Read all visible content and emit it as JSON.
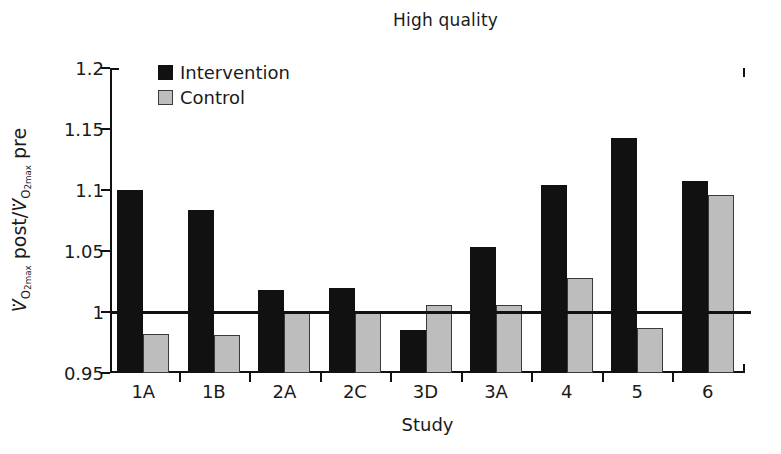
{
  "chart_data": {
    "type": "bar",
    "title": "High quality",
    "xlabel": "Study",
    "ylabel": "VO2max post/VO2max pre",
    "categories": [
      "1A",
      "1B",
      "2A",
      "2C",
      "3D",
      "3A",
      "4",
      "5",
      "6"
    ],
    "series": [
      {
        "name": "Intervention",
        "color": "#111111",
        "values": [
          1.1,
          1.084,
          1.018,
          1.02,
          0.985,
          1.053,
          1.104,
          1.143,
          1.107
        ]
      },
      {
        "name": "Control",
        "color": "#bdbdbd",
        "values": [
          0.982,
          0.981,
          1.001,
          1.001,
          1.006,
          1.006,
          1.028,
          0.987,
          1.096
        ]
      }
    ],
    "ylim": [
      0.95,
      1.2
    ],
    "yticks": [
      0.95,
      1.0,
      1.05,
      1.1,
      1.15,
      1.2
    ],
    "ytick_labels": [
      "0.95",
      "1",
      "1.05",
      "1.1",
      "1.15",
      "1.2"
    ],
    "reference_line": 1.0,
    "grid": false,
    "legend_position": "top-left"
  },
  "legend": {
    "items": [
      {
        "label": "Intervention"
      },
      {
        "label": "Control"
      }
    ]
  },
  "ylabel_parts": {
    "v1": "V",
    "sub1": "O",
    "sub1b": "2max",
    "mid": " post/",
    "v2": "V",
    "sub2": "O",
    "sub2b": "2max",
    "end": " pre"
  }
}
